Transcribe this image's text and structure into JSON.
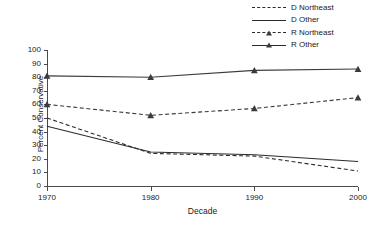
{
  "chart_data": {
    "type": "line",
    "title": "",
    "xlabel": "Decade",
    "ylabel": "Percent Conservative",
    "x": [
      1970,
      1980,
      1990,
      2000
    ],
    "categories": [
      "1970",
      "1980",
      "1990",
      "2000"
    ],
    "xlim": [
      1970,
      2000
    ],
    "ylim": [
      0,
      100
    ],
    "ytick_labels": [
      "0",
      "10",
      "20",
      "30",
      "40",
      "50",
      "60",
      "70",
      "80",
      "90",
      "100"
    ],
    "ytick_values": [
      0,
      10,
      20,
      30,
      40,
      50,
      60,
      70,
      80,
      90,
      100
    ],
    "grid": false,
    "legend_position": "top-right",
    "series": [
      {
        "name": "D Northeast",
        "values": [
          50,
          24,
          22,
          11
        ],
        "style": "dashed",
        "marker": "none",
        "color": "#2b2b2b"
      },
      {
        "name": "D Other",
        "values": [
          44,
          25,
          23,
          18
        ],
        "style": "solid",
        "marker": "none",
        "color": "#2b2b2b"
      },
      {
        "name": "R Northeast",
        "values": [
          60,
          52,
          57,
          65
        ],
        "style": "dashed",
        "marker": "triangle",
        "color": "#3b3b3b"
      },
      {
        "name": "R Other",
        "values": [
          81,
          80,
          85,
          86
        ],
        "style": "solid",
        "marker": "triangle",
        "color": "#3b3b3b"
      }
    ]
  },
  "legend": {
    "items": [
      {
        "label": "D Northeast"
      },
      {
        "label": "D Other"
      },
      {
        "label": "R Northeast"
      },
      {
        "label": "R Other"
      }
    ]
  },
  "axes": {
    "y_title": "Percent Conservative",
    "x_title": "Decade"
  }
}
